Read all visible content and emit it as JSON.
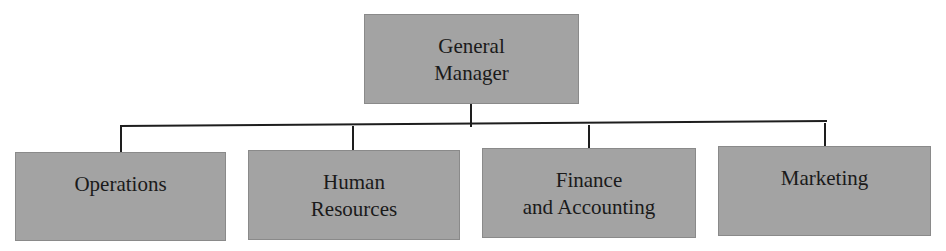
{
  "diagram": {
    "type": "org-chart",
    "root": {
      "label_line1": "General",
      "label_line2": "Manager"
    },
    "children": [
      {
        "label_line1": "Operations",
        "label_line2": ""
      },
      {
        "label_line1": "Human",
        "label_line2": "Resources"
      },
      {
        "label_line1": "Finance",
        "label_line2": "and Accounting"
      },
      {
        "label_line1": "Marketing",
        "label_line2": ""
      }
    ],
    "colors": {
      "box_fill": "#a3a3a3",
      "box_border": "#8a8a8a",
      "connector": "#1e1e1e",
      "text": "#1a1a1a"
    }
  }
}
